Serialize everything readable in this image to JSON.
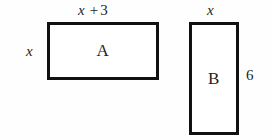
{
  "figure": {
    "background_color": "#fefefe",
    "stroke_color": "#111111",
    "text_color": "#1f1f1f",
    "shapes": [
      {
        "name": "rectangle-a",
        "interior_label": "A",
        "top_label": {
          "variable": "x",
          "operator": "+",
          "number": "3"
        },
        "left_label": "x"
      },
      {
        "name": "rectangle-b",
        "interior_label": "B",
        "top_label": {
          "variable": "x"
        },
        "right_label": "6"
      }
    ]
  },
  "labels": {
    "rect_a_letter": "A",
    "rect_b_letter": "B",
    "a_top_variable": "x",
    "a_top_operator": "+",
    "a_top_number": "3",
    "a_left_variable": "x",
    "b_top_variable": "x",
    "b_right_number": "6"
  }
}
